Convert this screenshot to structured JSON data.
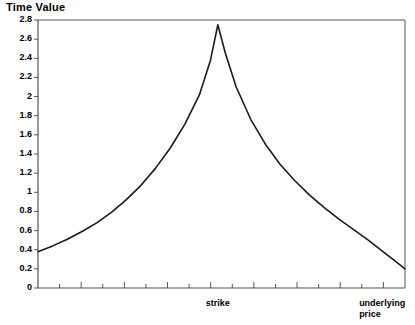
{
  "chart_data": {
    "type": "line",
    "title": "Time Value",
    "ylabel": "Time Value",
    "xlabel": "underlying price",
    "ylim": [
      0,
      2.8
    ],
    "grid": false,
    "legend": null,
    "y_ticks": [
      "0",
      "0.2",
      "0.4",
      "0.6",
      "0.8",
      "1",
      "1.2",
      "1.4",
      "1.6",
      "1.8",
      "2",
      "2.2",
      "2.4",
      "2.6",
      "2.8"
    ],
    "y_tick_values": [
      0,
      0.2,
      0.4,
      0.6,
      0.8,
      1,
      1.2,
      1.4,
      1.6,
      1.8,
      2,
      2.2,
      2.4,
      2.6,
      2.8
    ],
    "x_annotations": [
      {
        "label": "strike",
        "x_fraction": 0.49
      },
      {
        "label": "underlying",
        "x_fraction": 0.875
      },
      {
        "label": "price",
        "x_fraction": 0.875
      }
    ],
    "x_tick_count": 17,
    "series": [
      {
        "name": "Time Value",
        "x": [
          0.0,
          0.04,
          0.08,
          0.12,
          0.16,
          0.2,
          0.24,
          0.28,
          0.32,
          0.36,
          0.4,
          0.44,
          0.47,
          0.49,
          0.51,
          0.54,
          0.58,
          0.62,
          0.66,
          0.7,
          0.74,
          0.78,
          0.82,
          0.86,
          0.9,
          0.94,
          0.97,
          1.0
        ],
        "values": [
          0.38,
          0.44,
          0.51,
          0.59,
          0.68,
          0.79,
          0.92,
          1.07,
          1.25,
          1.46,
          1.71,
          2.02,
          2.38,
          2.75,
          2.46,
          2.1,
          1.76,
          1.5,
          1.29,
          1.12,
          0.97,
          0.84,
          0.72,
          0.61,
          0.5,
          0.38,
          0.29,
          0.2
        ]
      }
    ],
    "peak": {
      "value": 2.75,
      "at": "strike"
    },
    "start_value": 0.38,
    "end_value": 0.2,
    "colors": {
      "curve": "#1a1a1a",
      "axis": "#555555",
      "background": "#ffffff"
    }
  }
}
